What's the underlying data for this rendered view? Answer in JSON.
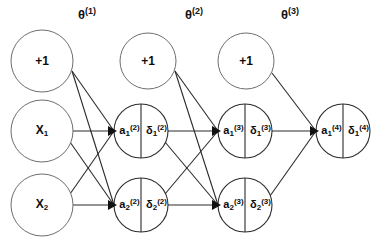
{
  "diagram": {
    "background_color": "#ffffff",
    "stroke_color": "#2b2b2b",
    "text_color": "#0d0d0d"
  },
  "weight_labels": [
    {
      "id": "theta1",
      "text": "θ",
      "sup": "(1)",
      "x": 78,
      "y": 6
    },
    {
      "id": "theta2",
      "text": "θ",
      "sup": "(2)",
      "x": 185,
      "y": 6
    },
    {
      "id": "theta3",
      "text": "θ",
      "sup": "(3)",
      "x": 281,
      "y": 6
    }
  ],
  "layers": [
    {
      "name": "input-layer",
      "nodes": [
        {
          "id": "bias-1",
          "kind": "plain",
          "label": "+1",
          "cx": 42,
          "cy": 61,
          "r": 31
        },
        {
          "id": "input-x1",
          "kind": "plain",
          "label": "X",
          "sub": "1",
          "cx": 42,
          "cy": 131,
          "r": 31
        },
        {
          "id": "input-x2",
          "kind": "plain",
          "label": "X",
          "sub": "2",
          "cx": 42,
          "cy": 205,
          "r": 31
        }
      ]
    },
    {
      "name": "hidden-layer-2",
      "nodes": [
        {
          "id": "bias-2",
          "kind": "plain",
          "label": "+1",
          "cx": 148,
          "cy": 61,
          "r": 28
        },
        {
          "id": "unit-a1-2",
          "kind": "split",
          "cx": 141,
          "cy": 131,
          "r": 27,
          "activation": "a",
          "activation_sub": "1",
          "activation_sup": "(2)",
          "delta": "δ",
          "delta_sub": "1",
          "delta_sup": "(2)"
        },
        {
          "id": "unit-a2-2",
          "kind": "split",
          "cx": 141,
          "cy": 205,
          "r": 27,
          "activation": "a",
          "activation_sub": "2",
          "activation_sup": "(2)",
          "delta": "δ",
          "delta_sub": "2",
          "delta_sup": "(2)"
        }
      ]
    },
    {
      "name": "hidden-layer-3",
      "nodes": [
        {
          "id": "bias-3",
          "kind": "plain",
          "label": "+1",
          "cx": 246,
          "cy": 61,
          "r": 28
        },
        {
          "id": "unit-a1-3",
          "kind": "split",
          "cx": 245,
          "cy": 131,
          "r": 27,
          "activation": "a",
          "activation_sub": "1",
          "activation_sup": "(3)",
          "delta": "δ",
          "delta_sub": "1",
          "delta_sup": "(3)"
        },
        {
          "id": "unit-a2-3",
          "kind": "split",
          "cx": 245,
          "cy": 205,
          "r": 27,
          "activation": "a",
          "activation_sub": "2",
          "activation_sup": "(3)",
          "delta": "δ",
          "delta_sub": "2",
          "delta_sup": "(3)"
        }
      ]
    },
    {
      "name": "output-layer",
      "nodes": [
        {
          "id": "unit-a1-4",
          "kind": "split",
          "cx": 343,
          "cy": 131,
          "r": 27,
          "activation": "a",
          "activation_sub": "1",
          "activation_sup": "(4)",
          "delta": "δ",
          "delta_sub": "1",
          "delta_sup": "(4)"
        }
      ]
    }
  ],
  "connections": [
    {
      "id": "c-bias1-a1_2",
      "from": "bias-1",
      "to": "unit-a1-2",
      "x1": 72,
      "y1": 71,
      "x2": 114,
      "y2": 131
    },
    {
      "id": "c-bias1-a2_2",
      "from": "bias-1",
      "to": "unit-a2-2",
      "x1": 72,
      "y1": 71,
      "x2": 114,
      "y2": 205
    },
    {
      "id": "c-x1-a1_2",
      "from": "input-x1",
      "to": "unit-a1-2",
      "x1": 73,
      "y1": 131,
      "x2": 114,
      "y2": 131
    },
    {
      "id": "c-x1-a2_2",
      "from": "input-x1",
      "to": "unit-a2-2",
      "x1": 70,
      "y1": 142,
      "x2": 114,
      "y2": 205
    },
    {
      "id": "c-x2-a1_2",
      "from": "input-x2",
      "to": "unit-a1-2",
      "x1": 70,
      "y1": 194,
      "x2": 114,
      "y2": 131
    },
    {
      "id": "c-x2-a2_2",
      "from": "input-x2",
      "to": "unit-a2-2",
      "x1": 73,
      "y1": 205,
      "x2": 114,
      "y2": 205
    },
    {
      "id": "c-bias2-a1_3",
      "from": "bias-2",
      "to": "unit-a1-3",
      "x1": 175,
      "y1": 71,
      "x2": 218,
      "y2": 131
    },
    {
      "id": "c-bias2-a2_3",
      "from": "bias-2",
      "to": "unit-a2-3",
      "x1": 175,
      "y1": 71,
      "x2": 218,
      "y2": 205
    },
    {
      "id": "c-a1_2-a1_3",
      "from": "unit-a1-2",
      "to": "unit-a1-3",
      "x1": 168,
      "y1": 131,
      "x2": 218,
      "y2": 131
    },
    {
      "id": "c-a1_2-a2_3",
      "from": "unit-a1-2",
      "to": "unit-a2-3",
      "x1": 165,
      "y1": 142,
      "x2": 218,
      "y2": 205
    },
    {
      "id": "c-a2_2-a1_3",
      "from": "unit-a2-2",
      "to": "unit-a1-3",
      "x1": 165,
      "y1": 194,
      "x2": 218,
      "y2": 131
    },
    {
      "id": "c-a2_2-a2_3",
      "from": "unit-a2-2",
      "to": "unit-a2-3",
      "x1": 168,
      "y1": 205,
      "x2": 218,
      "y2": 205
    },
    {
      "id": "c-bias3-a1_4",
      "from": "bias-3",
      "to": "unit-a1-4",
      "x1": 272,
      "y1": 73,
      "x2": 316,
      "y2": 131
    },
    {
      "id": "c-a1_3-a1_4",
      "from": "unit-a1-3",
      "to": "unit-a1-4",
      "x1": 272,
      "y1": 131,
      "x2": 316,
      "y2": 131
    },
    {
      "id": "c-a2_3-a1_4",
      "from": "unit-a2-3",
      "to": "unit-a1-4",
      "x1": 270,
      "y1": 196,
      "x2": 316,
      "y2": 131
    }
  ]
}
